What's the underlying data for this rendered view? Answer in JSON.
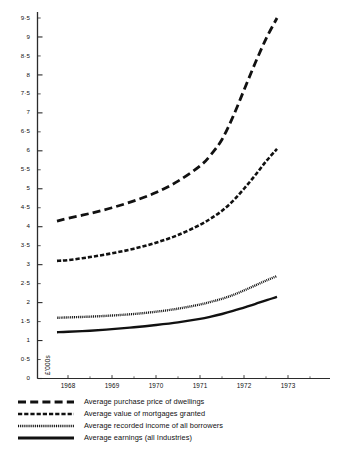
{
  "chart_data": {
    "type": "line",
    "title": "",
    "subtitle": "",
    "xlabel": "",
    "ylabel": "£'000s",
    "ylim": [
      0,
      9.8
    ],
    "xlim": [
      1967.5,
      1973.4
    ],
    "grid": false,
    "legend_position": "below",
    "y_ticks": [
      "0",
      "0·5",
      "1",
      "1·5",
      "2",
      "2·5",
      "3",
      "3·5",
      "4",
      "4·5",
      "5",
      "5·5",
      "6",
      "6·5",
      "7",
      "7·5",
      "8",
      "8·5",
      "9",
      "9·5"
    ],
    "y_tick_values": [
      0,
      0.5,
      1,
      1.5,
      2,
      2.5,
      3,
      3.5,
      4,
      4.5,
      5,
      5.5,
      6,
      6.5,
      7,
      7.5,
      8,
      8.5,
      9,
      9.5
    ],
    "x_ticks": [
      "1968",
      "1969",
      "1970",
      "1971",
      "1972",
      "1973"
    ],
    "x_tick_values": [
      1968,
      1969,
      1970,
      1971,
      1972,
      1973
    ],
    "x": [
      1967.75,
      1968,
      1968.5,
      1969,
      1969.5,
      1970,
      1970.5,
      1971,
      1971.25,
      1971.5,
      1971.75,
      1972,
      1972.25,
      1972.5,
      1972.75
    ],
    "series": [
      {
        "name": "Average purchase price of dwellings",
        "style": "long-dash",
        "color": "#111111",
        "values": [
          4.15,
          4.22,
          4.35,
          4.5,
          4.68,
          4.9,
          5.2,
          5.6,
          5.9,
          6.3,
          6.9,
          7.6,
          8.3,
          8.95,
          9.5
        ]
      },
      {
        "name": "Average value of mortgages granted",
        "style": "short-dash",
        "color": "#111111",
        "values": [
          3.1,
          3.12,
          3.2,
          3.3,
          3.42,
          3.58,
          3.78,
          4.05,
          4.22,
          4.42,
          4.68,
          5.0,
          5.35,
          5.72,
          6.05
        ]
      },
      {
        "name": "Average recorded income of all borrowers",
        "style": "dotted",
        "color": "#111111",
        "values": [
          1.6,
          1.61,
          1.63,
          1.66,
          1.7,
          1.76,
          1.84,
          1.95,
          2.02,
          2.1,
          2.2,
          2.32,
          2.45,
          2.58,
          2.7
        ]
      },
      {
        "name": "Average earnings  (all Industries)",
        "style": "solid",
        "color": "#111111",
        "values": [
          1.22,
          1.23,
          1.26,
          1.3,
          1.35,
          1.41,
          1.48,
          1.57,
          1.63,
          1.7,
          1.78,
          1.87,
          1.96,
          2.06,
          2.15
        ]
      }
    ]
  },
  "axis": {
    "unit_label": "£'000s"
  },
  "legend": {
    "items": [
      {
        "label": "Average purchase price of dwellings",
        "style": "long-dash"
      },
      {
        "label": "Average value of mortgages granted",
        "style": "short-dash"
      },
      {
        "label": "Average recorded income of all borrowers",
        "style": "dotted"
      },
      {
        "label": "Average earnings  (all Industries)",
        "style": "solid"
      }
    ]
  }
}
